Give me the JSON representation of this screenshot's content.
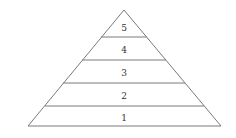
{
  "diagram": {
    "type": "pyramid",
    "levels": [
      {
        "label": "5",
        "position": "top"
      },
      {
        "label": "4"
      },
      {
        "label": "3"
      },
      {
        "label": "2"
      },
      {
        "label": "1",
        "position": "bottom"
      }
    ],
    "colors": {
      "stroke": "#7a7a7a",
      "text": "#333333",
      "background": "#ffffff"
    }
  }
}
